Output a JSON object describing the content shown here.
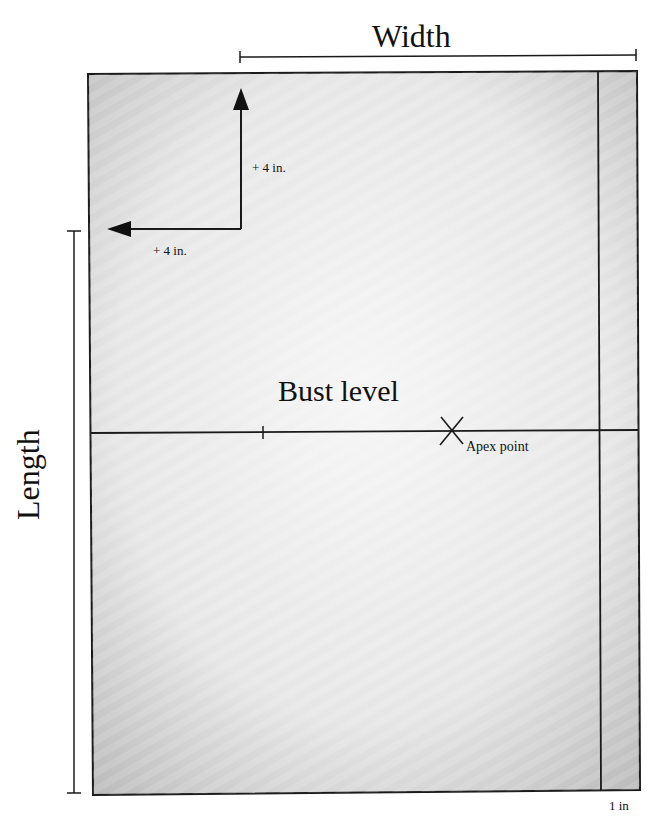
{
  "diagram": {
    "labels": {
      "width": "Width",
      "length": "Length",
      "bust_level": "Bust level",
      "apex_point": "Apex point",
      "up_offset": "+ 4 in.",
      "left_offset": "+ 4 in.",
      "right_margin": "1 in"
    },
    "colors": {
      "line": "#1a1a1a",
      "paper_light": "#f4f4f4",
      "paper_shade": "#bdbdbd",
      "background": "#ffffff"
    }
  }
}
